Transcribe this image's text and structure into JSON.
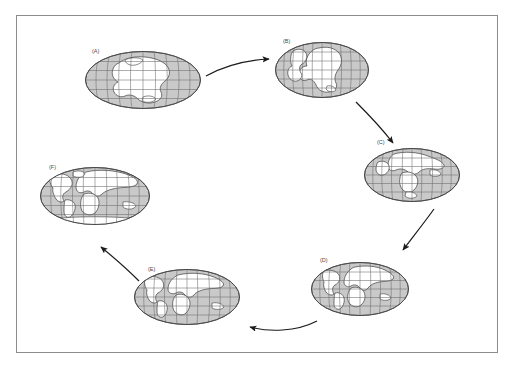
{
  "figure": {
    "type": "continental-drift-cycle-diagram",
    "background_color": "#ffffff",
    "frame_color": "#8d8d8d",
    "ocean_color": "#c9c9c9",
    "land_color": "#ffffff",
    "graticule_color": "#6b6b6b",
    "coastline_color": "#3c3c3c",
    "arrow_color": "#1a1a1a",
    "label_color": "#4a4a4a"
  },
  "globes": [
    {
      "id": "a",
      "label": "(A)",
      "cx": 143,
      "cy": 80,
      "rx": 58,
      "ry": 29,
      "label_x": 92,
      "label_y": 50,
      "description": "Pangaea supercontinent, earliest stage"
    },
    {
      "id": "b",
      "label": "(B)",
      "cx": 322,
      "cy": 70,
      "rx": 47,
      "ry": 28,
      "label_x": 285,
      "label_y": 40,
      "description": "Pangaea beginning to rift"
    },
    {
      "id": "c",
      "label": "(C)",
      "cx": 412,
      "cy": 175,
      "rx": 48,
      "ry": 27,
      "label_x": 379,
      "label_y": 141,
      "description": "Laurasia and Gondwana separating"
    },
    {
      "id": "d",
      "label": "(D)",
      "cx": 360,
      "cy": 289,
      "rx": 49,
      "ry": 27,
      "label_x": 321,
      "label_y": 261,
      "description": "Atlantic Ocean opening"
    },
    {
      "id": "e",
      "label": "(E)",
      "cx": 187,
      "cy": 297,
      "rx": 53,
      "ry": 28,
      "label_x": 148,
      "label_y": 269,
      "description": "Continents near-modern positions"
    },
    {
      "id": "f",
      "label": "(F)",
      "cx": 95,
      "cy": 196,
      "rx": 55,
      "ry": 29,
      "label_x": 49,
      "label_y": 168,
      "description": "Present-day world map"
    }
  ],
  "arrows": [
    {
      "id": "a-to-b",
      "from": "a",
      "to": "b",
      "direction": "right"
    },
    {
      "id": "b-to-c",
      "from": "b",
      "to": "c",
      "direction": "down-right"
    },
    {
      "id": "c-to-d",
      "from": "c",
      "to": "d",
      "direction": "down-left"
    },
    {
      "id": "d-to-e",
      "from": "d",
      "to": "e",
      "direction": "left"
    },
    {
      "id": "e-to-f",
      "from": "e",
      "to": "f",
      "direction": "up-left"
    }
  ]
}
